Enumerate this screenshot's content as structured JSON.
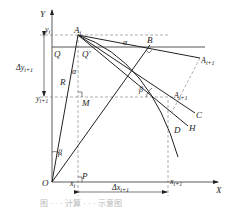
{
  "figure": {
    "axes": {
      "x_label": "X",
      "y_label": "Y",
      "origin_label": "O"
    },
    "points": {
      "A_i": "A",
      "A_i_sub": "i",
      "B": "B",
      "A_next_upper": "A",
      "A_next_upper_sub": "i+1",
      "A_next_lower": "A",
      "A_next_lower_sub": "i+1",
      "C": "C",
      "H": "H",
      "D": "D",
      "Q": "Q",
      "Q_prime": "Q'",
      "R": "R",
      "M": "M",
      "P": "P"
    },
    "angles": {
      "alpha_top": "α",
      "alpha_mid": "α",
      "beta_right": "β",
      "beta_bottom": "β"
    },
    "ticks": {
      "y_i": "y",
      "y_i_sub": "i",
      "y_next": "y",
      "y_next_sub": "i+1",
      "x_i": "x",
      "x_i_sub": "i",
      "x_next": "x",
      "x_next_sub": "i+1"
    },
    "dimensions": {
      "delta_y": "Δy",
      "delta_y_sub": "i+1",
      "delta_x": "Δx",
      "delta_x_sub": "i+1"
    },
    "caption": "图 · · · 计算 · · · 示意图"
  }
}
